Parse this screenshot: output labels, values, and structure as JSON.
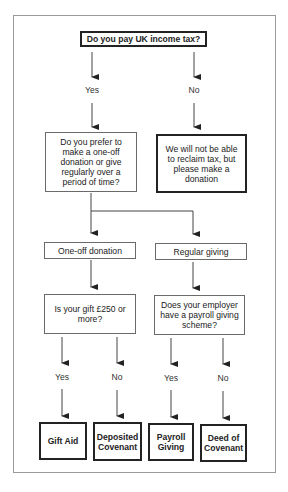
{
  "diagram": {
    "type": "flowchart",
    "title": "Do you pay UK income tax?",
    "nodes": {
      "q_tax": "Do you pay UK income tax?",
      "yes_1": "Yes",
      "no_1": "No",
      "q_prefer": "Do you prefer to make a one-off donation or give regularly over a period of time?",
      "no_tax_msg": "We will not be able to reclaim tax, but please make a donation",
      "one_off": "One-off donation",
      "regular": "Regular giving",
      "q_250": "Is your gift £250 or more?",
      "q_payroll": "Does your employer have a payroll giving scheme?",
      "yes_2": "Yes",
      "no_2": "No",
      "yes_3": "Yes",
      "no_3": "No",
      "gift_aid": "Gift Aid",
      "deposited_covenant": "Deposited Covenant",
      "payroll_giving": "Payroll Giving",
      "deed_of_covenant": "Deed of Covenant"
    },
    "edges": [
      {
        "from": "q_tax",
        "to": "q_prefer",
        "label": "Yes"
      },
      {
        "from": "q_tax",
        "to": "no_tax_msg",
        "label": "No"
      },
      {
        "from": "q_prefer",
        "to": "one_off"
      },
      {
        "from": "q_prefer",
        "to": "regular"
      },
      {
        "from": "one_off",
        "to": "q_250"
      },
      {
        "from": "regular",
        "to": "q_payroll"
      },
      {
        "from": "q_250",
        "to": "gift_aid",
        "label": "Yes"
      },
      {
        "from": "q_250",
        "to": "deposited_covenant",
        "label": "No"
      },
      {
        "from": "q_payroll",
        "to": "payroll_giving",
        "label": "Yes"
      },
      {
        "from": "q_payroll",
        "to": "deed_of_covenant",
        "label": "No"
      }
    ],
    "colors": {
      "line": "#222222",
      "frame": "#9a9a9a",
      "background": "#ffffff"
    }
  }
}
